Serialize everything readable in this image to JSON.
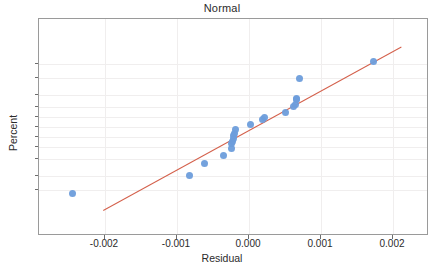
{
  "chart_data": {
    "type": "scatter",
    "title": "Normal",
    "xlabel": "Residual",
    "ylabel": "Percent",
    "grid": true,
    "legend": false,
    "xlim": [
      -0.00292,
      0.0025
    ],
    "ylim_percent": [
      1.2,
      99.0
    ],
    "xticks": [
      -0.002,
      -0.001,
      0.0,
      0.001,
      0.002
    ],
    "xtick_labels": [
      "-0.002",
      "-0.001",
      "0.000",
      "0.001",
      "0.002"
    ],
    "yticks": [
      5,
      10,
      20,
      30,
      40,
      50,
      60,
      70,
      80,
      90,
      95
    ],
    "ytick_labels": [
      "5",
      "10",
      "20",
      "30",
      "40",
      "50",
      "60",
      "70",
      "80",
      "90",
      "95"
    ],
    "point_color": "#6d9ddb",
    "line_color": "#d4604b",
    "series": [
      {
        "name": "residuals",
        "x": [
          -0.00245,
          -0.00082,
          -0.00062,
          -0.00036,
          -0.00025,
          -0.00024,
          -0.00023,
          -0.00022,
          -0.00021,
          -0.0002,
          -0.00019,
          2e-05,
          0.00019,
          0.00021,
          0.0005,
          0.00062,
          0.00065,
          0.00066,
          0.00066,
          0.0007,
          0.00173
        ],
        "percent": [
          4.2,
          10.2,
          16.8,
          22.5,
          28.5,
          33.5,
          35.5,
          38.5,
          41.0,
          43.0,
          47.5,
          52.5,
          57.5,
          59.5,
          64.5,
          70.5,
          72.0,
          76.0,
          77.0,
          89.5,
          95.5
        ]
      }
    ],
    "fit_line": {
      "x_start": -0.00203,
      "percent_start": 1.5,
      "x_end": 0.00211,
      "percent_end": 98.2
    }
  }
}
